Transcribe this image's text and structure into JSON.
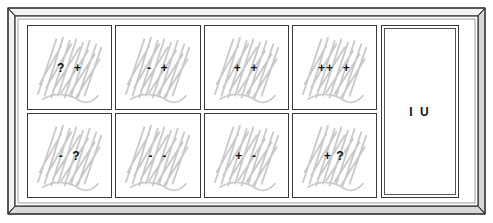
{
  "diagram": {
    "frame": {
      "style": "3d-beveled-case",
      "outline_color": "#3a3a3a",
      "bevel_color": "#6e6e6e",
      "face_color": "#ffffff"
    },
    "grid": {
      "rows": 2,
      "columns": 4,
      "cells": [
        {
          "label": "?  +",
          "row": 1,
          "column": 1,
          "scribbled": true
        },
        {
          "label": "-  +",
          "row": 1,
          "column": 2,
          "scribbled": true
        },
        {
          "label": "+  +",
          "row": 1,
          "column": 3,
          "scribbled": true
        },
        {
          "label": "++  +",
          "row": 1,
          "column": 4,
          "scribbled": true
        },
        {
          "label": "-  ?",
          "row": 2,
          "column": 1,
          "scribbled": true
        },
        {
          "label": "-  -",
          "row": 2,
          "column": 2,
          "scribbled": true
        },
        {
          "label": "+  -",
          "row": 2,
          "column": 3,
          "scribbled": true
        },
        {
          "label": "+ ?",
          "row": 2,
          "column": 4,
          "scribbled": true
        }
      ]
    },
    "right_panel": {
      "label": "I U",
      "scribbled": false
    },
    "colors": {
      "scribble": "#c9c9c9",
      "text": "#111111",
      "cell_border": "#3a3a3a"
    }
  }
}
